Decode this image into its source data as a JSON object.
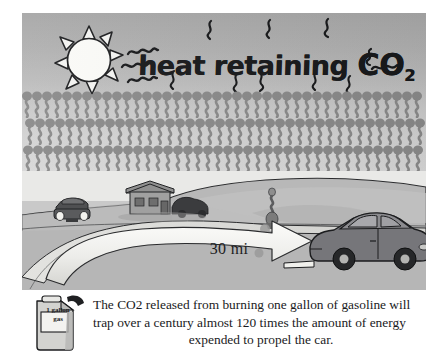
{
  "illustration": {
    "title": "heat retaining CO2",
    "headline": {
      "text_main": "heat retaining ",
      "text_co": "CO",
      "text_sub": "2"
    },
    "sun": {
      "icon": "sun-icon"
    },
    "heat_squiggles": {
      "icon": "squiggle-icon",
      "count": 12
    },
    "molecule_layer": {
      "icon": "co2-molecule-icon",
      "rows": 3,
      "per_row": 40,
      "color": "#8a8a8a"
    },
    "scene": {
      "arrow_label": "30 mi",
      "near_car": {
        "name": "car-side-view"
      },
      "far_car": {
        "name": "car-front-view"
      },
      "house": {
        "name": "house"
      },
      "barn_vehicle": {
        "name": "dark-vehicle"
      },
      "exhaust": {
        "name": "exhaust-puffs"
      },
      "person": {
        "name": "roadside-figure"
      }
    },
    "gas_can": {
      "label_line1": "1 gallon",
      "label_line2": "gas"
    },
    "caption": {
      "line1": "The CO2 released from burning one gallon of gasoline will",
      "line2": "trap over a century almost 120 times the amount of energy",
      "line3": "expended to propel the car."
    },
    "colors": {
      "sky_top": "#a7a7a7",
      "sky_bottom": "#d8d8d8",
      "molecule": "#8a8a8a",
      "ground": "#b4b4b4",
      "road": "#d9d9d9",
      "car_body": "#7d7d7d",
      "ink": "#1a1b1d",
      "paper": "#ffffff"
    }
  }
}
